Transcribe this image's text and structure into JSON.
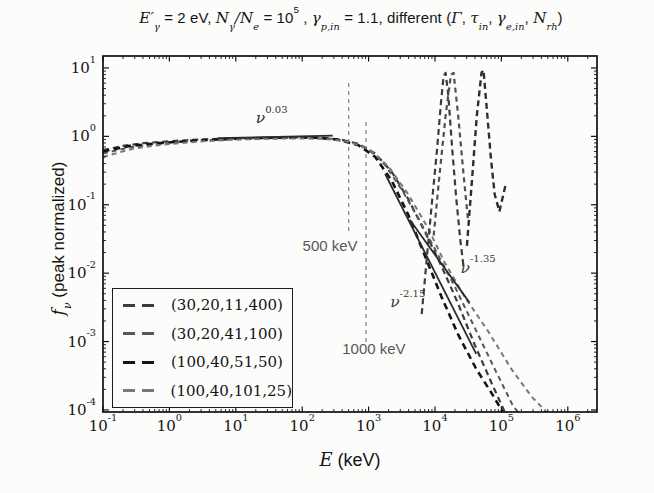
{
  "figure": {
    "background": "#fcfcfb"
  },
  "chart_data": {
    "type": "line",
    "xlabel": "$E$ (keV)",
    "ylabel": "$f_{ν}$ (peak normalized)",
    "x_scale": "log",
    "y_scale": "log",
    "xlim_log10": [
      -1,
      6.44
    ],
    "ylim_log10": [
      -4.03,
      1.175
    ],
    "grid": false,
    "legend_position": "lower-left",
    "frame_color": "#111111",
    "x_ticks": [
      {
        "log10": -1,
        "label": "10^{-1}"
      },
      {
        "log10": 0,
        "label": "10^{0}"
      },
      {
        "log10": 1,
        "label": "10^{1}"
      },
      {
        "log10": 2,
        "label": "10^{2}"
      },
      {
        "log10": 3,
        "label": "10^{3}"
      },
      {
        "log10": 4,
        "label": "10^{4}"
      },
      {
        "log10": 5,
        "label": "10^{5}"
      },
      {
        "log10": 6,
        "label": "10^{6}"
      }
    ],
    "y_ticks": [
      {
        "log10": 1,
        "label": "10^{1}"
      },
      {
        "log10": 0,
        "label": "10^{0}"
      },
      {
        "log10": -1,
        "label": "10^{-1}"
      },
      {
        "log10": -2,
        "label": "10^{-2}"
      },
      {
        "log10": -3,
        "label": "10^{-3}"
      },
      {
        "log10": -4,
        "label": "10^{-4}"
      }
    ],
    "series": [
      {
        "name": "(30,20,11,400)",
        "legend": true,
        "style": "dashed",
        "color": "#3c3c3c",
        "width": 2.2,
        "dash": "6 4",
        "points_log10": [
          [
            -1,
            -0.2
          ],
          [
            -0.7,
            -0.14
          ],
          [
            -0.4,
            -0.1
          ],
          [
            0,
            -0.07
          ],
          [
            0.5,
            -0.045
          ],
          [
            1.0,
            -0.03
          ],
          [
            1.5,
            -0.02
          ],
          [
            2.0,
            -0.015
          ],
          [
            2.3,
            -0.02
          ],
          [
            2.6,
            -0.05
          ],
          [
            2.85,
            -0.11
          ],
          [
            3.1,
            -0.25
          ],
          [
            3.35,
            -0.52
          ],
          [
            3.6,
            -0.92
          ],
          [
            3.85,
            -1.4
          ],
          [
            4.1,
            -1.9
          ],
          [
            4.35,
            -2.45
          ],
          [
            4.6,
            -3.05
          ],
          [
            4.85,
            -3.6
          ],
          [
            5.05,
            -4.03
          ]
        ]
      },
      {
        "name": "(30,20,41,100)",
        "legend": true,
        "style": "dashed",
        "color": "#585858",
        "width": 2.0,
        "dash": "5 4",
        "points_log10": [
          [
            -1,
            -0.25
          ],
          [
            -0.6,
            -0.16
          ],
          [
            -0.2,
            -0.11
          ],
          [
            0.3,
            -0.07
          ],
          [
            0.8,
            -0.045
          ],
          [
            1.4,
            -0.03
          ],
          [
            2.0,
            -0.02
          ],
          [
            2.45,
            -0.035
          ],
          [
            2.75,
            -0.09
          ],
          [
            3.0,
            -0.19
          ],
          [
            3.25,
            -0.42
          ],
          [
            3.5,
            -0.78
          ],
          [
            3.75,
            -1.2
          ],
          [
            4.0,
            -1.65
          ],
          [
            4.3,
            -2.2
          ],
          [
            4.6,
            -2.8
          ],
          [
            4.9,
            -3.4
          ],
          [
            5.18,
            -3.95
          ],
          [
            5.25,
            -4.03
          ]
        ]
      },
      {
        "name": "(100,40,51,50)",
        "legend": true,
        "style": "dashed",
        "color": "#141414",
        "width": 2.6,
        "dash": "6.5 4.5",
        "points_log10": [
          [
            -1,
            -0.22
          ],
          [
            -0.6,
            -0.14
          ],
          [
            -0.1,
            -0.095
          ],
          [
            0.4,
            -0.06
          ],
          [
            1.0,
            -0.035
          ],
          [
            1.6,
            -0.02
          ],
          [
            2.2,
            -0.02
          ],
          [
            2.55,
            -0.05
          ],
          [
            2.85,
            -0.13
          ],
          [
            3.1,
            -0.3
          ],
          [
            3.35,
            -0.65
          ],
          [
            3.6,
            -1.15
          ],
          [
            3.85,
            -1.75
          ],
          [
            4.1,
            -2.35
          ],
          [
            4.35,
            -2.9
          ],
          [
            4.62,
            -3.4
          ],
          [
            4.85,
            -3.75
          ],
          [
            5.02,
            -4.03
          ]
        ]
      },
      {
        "name": "(100,40,101,25)",
        "legend": true,
        "style": "dashed",
        "color": "#787878",
        "width": 2.0,
        "dash": "5 4",
        "points_log10": [
          [
            -1,
            -0.3
          ],
          [
            -0.55,
            -0.18
          ],
          [
            -0.1,
            -0.12
          ],
          [
            0.5,
            -0.07
          ],
          [
            1.1,
            -0.045
          ],
          [
            1.8,
            -0.03
          ],
          [
            2.35,
            -0.035
          ],
          [
            2.7,
            -0.08
          ],
          [
            3.0,
            -0.18
          ],
          [
            3.3,
            -0.44
          ],
          [
            3.6,
            -0.85
          ],
          [
            3.9,
            -1.35
          ],
          [
            4.15,
            -1.85
          ],
          [
            4.45,
            -2.35
          ],
          [
            4.8,
            -2.85
          ],
          [
            5.15,
            -3.4
          ],
          [
            5.45,
            -3.8
          ],
          [
            5.68,
            -4.03
          ]
        ]
      },
      {
        "name": "annihilation-peak-a",
        "legend": false,
        "style": "dashed",
        "color": "#3c3c3c",
        "width": 2.2,
        "dash": "6 4",
        "points_log10": [
          [
            3.8,
            -2.6
          ],
          [
            3.88,
            -1.75
          ],
          [
            3.95,
            -1.0
          ],
          [
            4.03,
            -0.2
          ],
          [
            4.09,
            0.5
          ],
          [
            4.13,
            0.88
          ],
          [
            4.16,
            0.93
          ],
          [
            4.2,
            0.6
          ],
          [
            4.26,
            -0.2
          ],
          [
            4.32,
            -0.9
          ],
          [
            4.38,
            -1.5
          ],
          [
            4.43,
            -1.9
          ]
        ]
      },
      {
        "name": "annihilation-peak-b",
        "legend": false,
        "style": "dashed",
        "color": "#505050",
        "width": 2.2,
        "dash": "5 4",
        "points_log10": [
          [
            3.98,
            -1.45
          ],
          [
            4.07,
            -0.55
          ],
          [
            4.16,
            0.3
          ],
          [
            4.24,
            0.9
          ],
          [
            4.28,
            0.93
          ],
          [
            4.35,
            0.3
          ],
          [
            4.43,
            -0.55
          ],
          [
            4.5,
            -1.25
          ]
        ]
      },
      {
        "name": "annihilation-peak-c",
        "legend": false,
        "style": "dashed",
        "color": "#2e2e2e",
        "width": 2.4,
        "dash": "6 4",
        "points_log10": [
          [
            4.48,
            -1.6
          ],
          [
            4.56,
            -0.6
          ],
          [
            4.63,
            0.3
          ],
          [
            4.7,
            0.93
          ],
          [
            4.73,
            0.97
          ],
          [
            4.78,
            0.4
          ],
          [
            4.84,
            -0.3
          ],
          [
            4.9,
            -0.85
          ],
          [
            4.97,
            -1.1
          ],
          [
            5.06,
            -0.72
          ]
        ]
      },
      {
        "name": "powerlaw-ref-nu-0.03",
        "legend": false,
        "style": "solid",
        "color": "#2b2b2b",
        "width": 1.8,
        "dash": "",
        "points_log10": [
          [
            0.73,
            -0.025
          ],
          [
            2.46,
            0.01
          ]
        ]
      },
      {
        "name": "powerlaw-ref-nu-2.15",
        "legend": false,
        "style": "solid",
        "color": "#2b2b2b",
        "width": 1.8,
        "dash": "",
        "points_log10": [
          [
            3.25,
            -0.55
          ],
          [
            4.62,
            -3.18
          ]
        ]
      },
      {
        "name": "powerlaw-ref-nu-1.35",
        "legend": false,
        "style": "solid",
        "color": "#2b2b2b",
        "width": 1.8,
        "dash": "",
        "points_log10": [
          [
            3.62,
            -1.22
          ],
          [
            4.52,
            -2.43
          ]
        ]
      }
    ],
    "guides": [
      {
        "label": "500 keV",
        "log10_x": 2.7,
        "y_from_log10": 0.78,
        "y_to_log10": -1.43,
        "color": "#8f8f8f"
      },
      {
        "label": "1000 keV",
        "log10_x": 2.96,
        "y_from_log10": 0.21,
        "y_to_log10": -3.03,
        "color": "#8f8f8f"
      }
    ],
    "annotations": [
      {
        "text": "$ν$^{0.03}",
        "kind": "math",
        "log10_x": 1.54,
        "log10_y": 0.25,
        "color": "#2e2e2e"
      },
      {
        "text": "500 keV",
        "kind": "plain",
        "log10_x": 2.42,
        "log10_y": -1.59,
        "color": "#585858"
      },
      {
        "text": "1000 keV",
        "kind": "plain",
        "log10_x": 3.08,
        "log10_y": -3.09,
        "color": "#585858"
      },
      {
        "text": "$ν$^{-2.15}",
        "kind": "math",
        "log10_x": 3.59,
        "log10_y": -2.44,
        "color": "#3a3a3a"
      },
      {
        "text": "$ν$^{-1.35}",
        "kind": "math",
        "log10_x": 4.65,
        "log10_y": -1.94,
        "color": "#3a3a3a"
      }
    ]
  }
}
